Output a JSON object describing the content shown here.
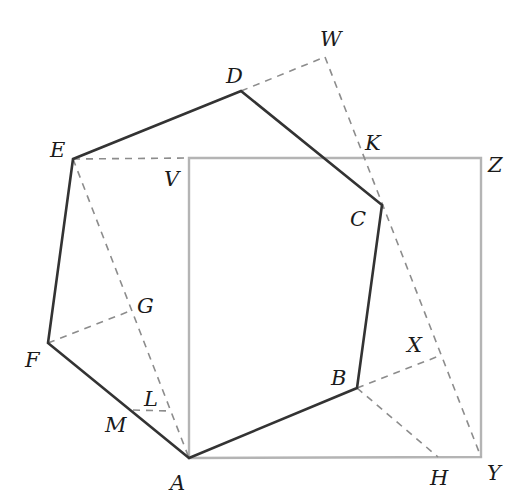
{
  "diagram": {
    "type": "geometry",
    "colors": {
      "hexagon": "#333333",
      "square": "#b4b4b4",
      "construction": "#8c8c8c",
      "label": "#1a1a1a"
    },
    "points": {
      "A": {
        "x": 189,
        "y": 458,
        "label": "A"
      },
      "B": {
        "x": 357,
        "y": 388,
        "label": "B"
      },
      "C": {
        "x": 382,
        "y": 205,
        "label": "C"
      },
      "D": {
        "x": 241,
        "y": 91,
        "label": "D"
      },
      "E": {
        "x": 73,
        "y": 159,
        "label": "E"
      },
      "F": {
        "x": 48,
        "y": 343,
        "label": "F"
      },
      "G": {
        "x": 130,
        "y": 311,
        "label": "G"
      },
      "H": {
        "x": 438,
        "y": 457,
        "label": "H"
      },
      "K": {
        "x": 364,
        "y": 158,
        "label": "K"
      },
      "L": {
        "x": 170,
        "y": 411,
        "label": "L"
      },
      "M": {
        "x": 133,
        "y": 410,
        "label": "M"
      },
      "V": {
        "x": 189,
        "y": 158,
        "label": "V"
      },
      "W": {
        "x": 325,
        "y": 57,
        "label": "W"
      },
      "X": {
        "x": 439,
        "y": 356,
        "label": "X"
      },
      "Y": {
        "x": 481,
        "y": 457,
        "label": "Y"
      },
      "Z": {
        "x": 481,
        "y": 158,
        "label": "Z"
      }
    },
    "hexagon": [
      "A",
      "B",
      "C",
      "D",
      "E",
      "F"
    ],
    "square": [
      "A",
      "V",
      "Z",
      "Y"
    ],
    "dashed_segments": [
      [
        "E",
        "V"
      ],
      [
        "D",
        "W"
      ],
      [
        "W",
        "Y"
      ],
      [
        "E",
        "A"
      ],
      [
        "F",
        "G"
      ],
      [
        "B",
        "X"
      ],
      [
        "B",
        "H"
      ],
      [
        "M",
        "L"
      ]
    ]
  }
}
